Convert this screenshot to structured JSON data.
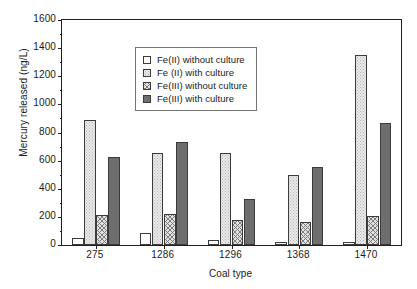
{
  "chart_data": {
    "type": "bar",
    "title": "",
    "xlabel": "Coal type",
    "ylabel": "Mercury released (ng/L)",
    "categories": [
      "275",
      "1286",
      "1296",
      "1368",
      "1470"
    ],
    "series": [
      {
        "name": "Fe(II) without culture",
        "pattern": "open",
        "values": [
          52,
          88,
          37,
          18,
          18
        ]
      },
      {
        "name": "Fe (II) with culture",
        "pattern": "dot-light",
        "values": [
          889,
          654,
          654,
          498,
          1351
        ]
      },
      {
        "name": "Fe(III) without culture",
        "pattern": "crosshatch",
        "values": [
          211,
          220,
          176,
          164,
          204
        ]
      },
      {
        "name": "Fe(III) with culture",
        "pattern": "solid-dark",
        "values": [
          626,
          732,
          327,
          554,
          868
        ]
      }
    ],
    "ylim": [
      0,
      1600
    ],
    "ytick_values": [
      0,
      200,
      400,
      600,
      800,
      1000,
      1200,
      1400,
      1600
    ],
    "ytick_labels": [
      "0",
      "200",
      "400",
      "600",
      "800",
      "1000",
      "1200",
      "1400",
      "1600"
    ],
    "grid": false,
    "legend_position": "upper left",
    "legend_entries": [
      "Fe(II) without culture",
      "Fe (II) with culture",
      "Fe(III) without culture",
      "Fe(III) with culture"
    ]
  }
}
